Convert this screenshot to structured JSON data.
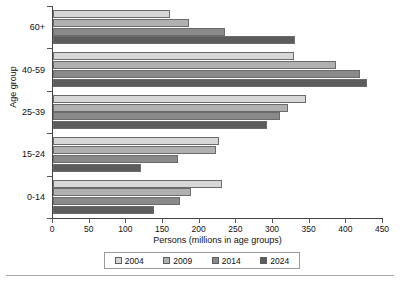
{
  "chart_data": {
    "type": "bar",
    "orientation": "horizontal",
    "title": "",
    "xlabel": "Persons (millions in age groups)",
    "ylabel": "Age group",
    "categories": [
      "0-14",
      "15-24",
      "25-39",
      "40-59",
      "60+"
    ],
    "categories_top_to_bottom": [
      "60+",
      "40-59",
      "25-39",
      "15-24",
      "0-14"
    ],
    "xlim": [
      0,
      450
    ],
    "xticks": [
      0,
      50,
      100,
      150,
      200,
      250,
      300,
      350,
      400,
      450
    ],
    "xtick_labels": [
      "0",
      "50",
      "100",
      "150",
      "200",
      "250",
      "300",
      "350",
      "400",
      "450"
    ],
    "grid": false,
    "legend_position": "bottom",
    "series": [
      {
        "name": "2004",
        "color": "#d7d7d7",
        "values": [
          230,
          226,
          345,
          328,
          160
        ]
      },
      {
        "name": "2009",
        "color": "#b0b0b0",
        "values": [
          188,
          222,
          320,
          386,
          186
        ]
      },
      {
        "name": "2014",
        "color": "#8a8a8a",
        "values": [
          173,
          170,
          310,
          418,
          234
        ]
      },
      {
        "name": "2024",
        "color": "#5c5c5c",
        "values": [
          138,
          120,
          292,
          428,
          330
        ]
      }
    ]
  },
  "legend": {
    "items": [
      {
        "label": "2004"
      },
      {
        "label": "2009"
      },
      {
        "label": "2014"
      },
      {
        "label": "2024"
      }
    ]
  }
}
